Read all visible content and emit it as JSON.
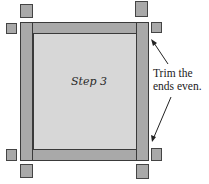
{
  "diagram": {
    "center_label": "Step 3",
    "annotation": {
      "line1": "Trim the",
      "line2": "ends even."
    },
    "colors": {
      "strip_fill": "#a9a9a9",
      "center_fill": "#d7d7d7",
      "outline": "#3a3a3a",
      "text": "#222222",
      "background": "#ffffff"
    },
    "parts": {
      "strips": [
        "left-border-strip",
        "right-border-strip",
        "top-border-strip",
        "bottom-border-strip"
      ],
      "center": "quilt-center-panel",
      "squares": [
        "trimmed-end-top-left-vertical",
        "trimmed-end-top-left-horizontal",
        "trimmed-end-top-right-vertical",
        "trimmed-end-top-right-horizontal",
        "trimmed-end-bottom-left-horizontal",
        "trimmed-end-bottom-left-vertical",
        "trimmed-end-bottom-right-horizontal",
        "trimmed-end-bottom-right-vertical"
      ],
      "arrows": [
        "arrow-to-top-right-end",
        "arrow-to-bottom-right-end"
      ]
    }
  }
}
